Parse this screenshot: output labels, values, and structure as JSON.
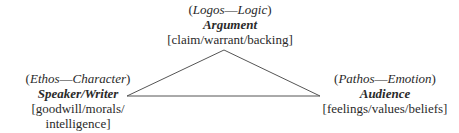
{
  "diagram": {
    "type": "rhetorical-triangle",
    "top": {
      "appeal": "Logos",
      "meaning": "Logic",
      "title": "Argument",
      "elements": "[claim/warrant/backing]"
    },
    "left": {
      "appeal": "Ethos",
      "meaning": "Character",
      "title": "Speaker/Writer",
      "elements_line1": "[goodwill/morals/",
      "elements_line2": "intelligence]"
    },
    "right": {
      "appeal": "Pathos",
      "meaning": "Emotion",
      "title": "Audience",
      "elements": "[feelings/values/beliefs]"
    },
    "dash": "—",
    "line_color": "#555555"
  }
}
